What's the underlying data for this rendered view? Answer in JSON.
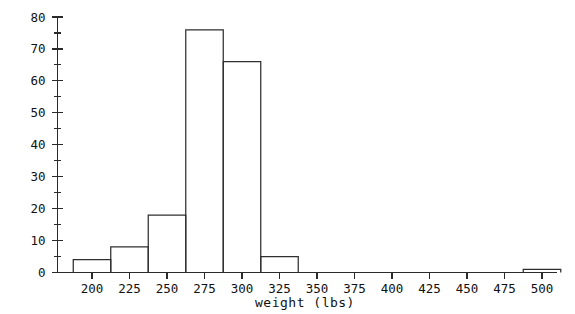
{
  "chart_data": {
    "type": "bar",
    "title": "",
    "subtitle": "",
    "xlabel": "weight (lbs)",
    "ylabel": "",
    "xlim": [
      180,
      520
    ],
    "ylim": [
      0,
      80
    ],
    "grid": false,
    "legend": false,
    "bin_width": 25,
    "bin_edges": [
      187.5,
      212.5,
      237.5,
      262.5,
      287.5,
      312.5,
      337.5,
      487.5,
      512.5
    ],
    "categories": [
      "187.5-212.5",
      "212.5-237.5",
      "237.5-262.5",
      "262.5-287.5",
      "287.5-312.5",
      "312.5-337.5",
      "487.5-512.5"
    ],
    "bins": [
      {
        "start": 187.5,
        "end": 212.5,
        "count": 4
      },
      {
        "start": 212.5,
        "end": 237.5,
        "count": 8
      },
      {
        "start": 237.5,
        "end": 262.5,
        "count": 18
      },
      {
        "start": 262.5,
        "end": 287.5,
        "count": 76
      },
      {
        "start": 287.5,
        "end": 312.5,
        "count": 66
      },
      {
        "start": 312.5,
        "end": 337.5,
        "count": 5
      },
      {
        "start": 487.5,
        "end": 512.5,
        "count": 1
      }
    ],
    "values": [
      4,
      8,
      18,
      76,
      66,
      5,
      1
    ],
    "x_ticks": [
      200,
      225,
      250,
      275,
      300,
      325,
      350,
      375,
      400,
      425,
      450,
      475,
      500
    ],
    "x_tick_labels": [
      "200",
      "225",
      "250",
      "275",
      "300",
      "325",
      "350",
      "375",
      "400",
      "425",
      "450",
      "475",
      "500"
    ],
    "y_ticks": [
      0,
      10,
      20,
      30,
      40,
      50,
      60,
      70,
      80
    ],
    "y_tick_labels": [
      "0",
      "10",
      "20",
      "30",
      "40",
      "50",
      "60",
      "70",
      "80"
    ],
    "y_minor_ticks": [
      5,
      15,
      25,
      35,
      45,
      55,
      65,
      75
    ],
    "colors": {
      "bar_stroke": "#2f2f2f",
      "bar_fill": "none",
      "axis": "#2b2b2b",
      "text": "#111111",
      "background": "#ffffff"
    }
  }
}
